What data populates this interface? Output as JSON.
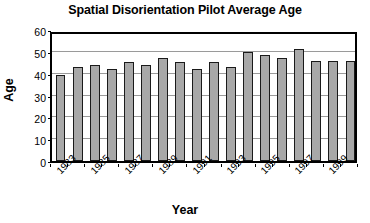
{
  "chart_data": {
    "type": "bar",
    "title": "Spatial Disorientation Pilot Average Age",
    "xlabel": "Year",
    "ylabel": "Age",
    "categories": [
      "1983",
      "1984",
      "1985",
      "1986",
      "1987",
      "1988",
      "1989",
      "1990",
      "1991",
      "1992",
      "1993",
      "1994",
      "1995",
      "1996",
      "1997",
      "1998",
      "1999",
      "2000"
    ],
    "values": [
      39.5,
      43,
      43.8,
      42.2,
      45.3,
      43.8,
      47,
      45.3,
      42.3,
      45.3,
      43,
      50,
      48.5,
      47,
      51.2,
      46,
      46,
      46
    ],
    "ylim": [
      0,
      60
    ],
    "yticks": [
      0,
      10,
      20,
      30,
      40,
      50,
      60
    ],
    "ytick_labels": [
      "0",
      "10",
      "20",
      "30",
      "40",
      "50",
      "60"
    ],
    "xtick_labels": [
      "1983",
      "1985",
      "1987",
      "1989",
      "1991",
      "1993",
      "1995",
      "1997",
      "1999"
    ],
    "xtick_categories": [
      "1983",
      "1985",
      "1987",
      "1989",
      "1991",
      "1993",
      "1995",
      "1997",
      "1999"
    ],
    "grid": true,
    "legend": false,
    "legend_position": "none",
    "bar_color": "#a8a8a8",
    "bar_edge_color": "#1a1a1a",
    "grid_color": "#9a9a9a",
    "frame_color": "#000000",
    "background_color": "#ffffff"
  }
}
